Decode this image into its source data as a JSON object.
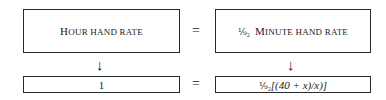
{
  "top_row": {
    "left": {
      "cap": "H",
      "rest": "OUR HAND RATE"
    },
    "equals": "=",
    "right": {
      "fraction": "⅑₂",
      "cap": "M",
      "rest": "INUTE HAND RATE"
    }
  },
  "arrows": {
    "left": "↓",
    "right": "↓"
  },
  "bottom_row": {
    "left": "1",
    "equals": "=",
    "right": {
      "fraction": "⅑₂",
      "expr": "[(40 + x)/x)]"
    }
  }
}
